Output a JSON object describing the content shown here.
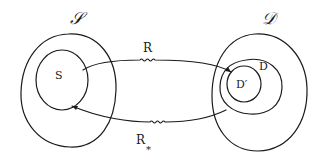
{
  "diagram": {
    "type": "set-mapping",
    "sets": [
      {
        "id": "script-S",
        "label": "𝒮",
        "role": "source-space"
      },
      {
        "id": "S",
        "label": "S",
        "role": "subset-of-script-S"
      },
      {
        "id": "script-D",
        "label": "𝒟",
        "role": "target-space"
      },
      {
        "id": "D",
        "label": "D",
        "role": "subset-of-script-D"
      },
      {
        "id": "D-prime",
        "label": "D′",
        "role": "subset-of-D"
      }
    ],
    "arrows": [
      {
        "id": "R",
        "label": "R",
        "from": "S",
        "to": "D-prime",
        "style": "wavy-arrow"
      },
      {
        "id": "R-star",
        "label": "R",
        "subscript": "*",
        "from": "D",
        "to": "S",
        "style": "wavy-arrow"
      }
    ]
  },
  "labels": {
    "script_S": "𝒮",
    "S": "S",
    "script_D": "𝒟",
    "D": "D",
    "D_prime": "D′",
    "R": "R",
    "R_star": "R",
    "R_star_sub": "*"
  }
}
